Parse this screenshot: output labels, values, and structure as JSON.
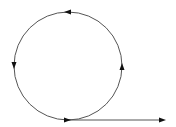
{
  "diagram": {
    "colors": {
      "stroke": "#555555",
      "arrow": "#111111",
      "background": "#ffffff"
    },
    "circle": {
      "cx": 68,
      "cy": 66,
      "r": 54
    },
    "circle_arrows": [
      {
        "position": "top",
        "direction": "left"
      },
      {
        "position": "left",
        "direction": "down"
      },
      {
        "position": "bottom",
        "direction": "right"
      },
      {
        "position": "right",
        "direction": "up"
      }
    ],
    "tangent_line": {
      "x1": 68,
      "y1": 120,
      "x2": 164,
      "y2": 120,
      "arrow": "right"
    }
  }
}
